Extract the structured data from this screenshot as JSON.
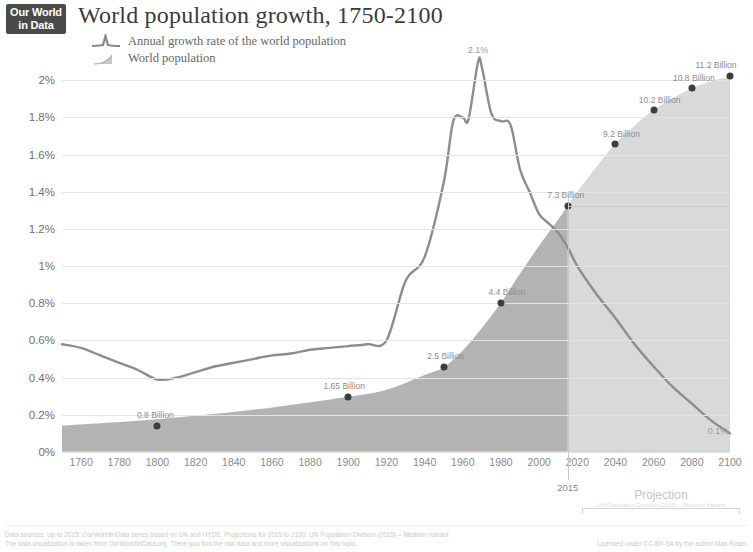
{
  "branding": {
    "line1": "Our World",
    "line2": "in Data"
  },
  "header": {
    "title": "World population growth, 1750-2100"
  },
  "legend": {
    "items": [
      {
        "id": "growth-rate",
        "label": "Annual growth rate of the world population",
        "mark": "line-peak",
        "color": "#8a8a8a"
      },
      {
        "id": "population",
        "label": "World population",
        "mark": "area-wedge",
        "color": "#b9b9b9"
      }
    ]
  },
  "axes": {
    "y": {
      "ticks": [
        "0%",
        "0.2%",
        "0.4%",
        "0.6%",
        "0.8%",
        "1%",
        "1.2%",
        "1.4%",
        "1.6%",
        "1.8%",
        "2%"
      ],
      "values": [
        0,
        0.2,
        0.4,
        0.6,
        0.8,
        1.0,
        1.2,
        1.4,
        1.6,
        1.8,
        2.0
      ],
      "min": 0,
      "max": 2.12
    },
    "x": {
      "ticks": [
        "1760",
        "1780",
        "1800",
        "1820",
        "1840",
        "1860",
        "1880",
        "1900",
        "1920",
        "1940",
        "1960",
        "1980",
        "2000",
        "2020",
        "2040",
        "2060",
        "2080",
        "2100"
      ],
      "values": [
        1760,
        1780,
        1800,
        1820,
        1840,
        1860,
        1880,
        1900,
        1920,
        1940,
        1960,
        1980,
        2000,
        2020,
        2040,
        2060,
        2080,
        2100
      ],
      "min": 1750,
      "max": 2100
    }
  },
  "annotations": {
    "projection_year": "2015",
    "projection_label": "Projection",
    "projection_sublabel": "UN Population Division (2015) – Medium Variant",
    "peak_growth": {
      "label": "2.1%",
      "year": 1968,
      "value": 2.1
    },
    "end_growth": {
      "label": "0.1%",
      "year": 2100,
      "value": 0.1
    }
  },
  "footer": {
    "line1": "Data sources: Up to 2015: OurWorldInData series based on UN and HYDE. Projections for 2015 to 2100: UN Population Division (2015) – Medium Variant",
    "line2": "The data visualization is taken from OurWorldInData.org. There you find the raw data and more visualizations on this topic.",
    "license": "Licensed under CC-BY-SA by the author Max Roser."
  },
  "colors": {
    "population_area_historic": "#b3b3b3",
    "population_area_projection": "#d9d9d9",
    "growth_line": "#8d8d8d",
    "dot": "#3d3d3d",
    "grid": "#e4e4e4",
    "text": "#7a7a7a"
  },
  "chart_data": {
    "type": "line",
    "title": "World population growth, 1750-2100",
    "xlabel": "",
    "ylabel": "",
    "xlim": [
      1750,
      2100
    ],
    "ylim": [
      0,
      2.12
    ],
    "grid": true,
    "legend_position": "top-left",
    "series": [
      {
        "name": "Annual growth rate of the world population",
        "type": "line",
        "axis": "left",
        "unit": "%",
        "x": [
          1750,
          1760,
          1770,
          1780,
          1790,
          1800,
          1810,
          1820,
          1830,
          1840,
          1850,
          1860,
          1870,
          1880,
          1890,
          1900,
          1910,
          1920,
          1930,
          1940,
          1950,
          1955,
          1960,
          1963,
          1968,
          1970,
          1975,
          1980,
          1985,
          1990,
          1995,
          2000,
          2005,
          2010,
          2015,
          2020,
          2030,
          2040,
          2050,
          2060,
          2070,
          2080,
          2090,
          2100
        ],
        "y": [
          0.58,
          0.56,
          0.52,
          0.48,
          0.44,
          0.39,
          0.4,
          0.43,
          0.46,
          0.48,
          0.5,
          0.52,
          0.53,
          0.55,
          0.56,
          0.57,
          0.58,
          0.6,
          0.92,
          1.05,
          1.45,
          1.78,
          1.8,
          1.79,
          2.1,
          2.07,
          1.82,
          1.78,
          1.76,
          1.52,
          1.4,
          1.28,
          1.23,
          1.18,
          1.1,
          1.0,
          0.85,
          0.72,
          0.58,
          0.46,
          0.35,
          0.26,
          0.17,
          0.1
        ]
      },
      {
        "name": "World population",
        "type": "area",
        "axis": "right",
        "unit": "Billion",
        "x": [
          1750,
          1800,
          1850,
          1900,
          1920,
          1940,
          1950,
          1960,
          1970,
          1980,
          1990,
          2000,
          2010,
          2015,
          2020,
          2030,
          2040,
          2050,
          2060,
          2070,
          2080,
          2090,
          2100
        ],
        "y": [
          0.79,
          0.98,
          1.26,
          1.65,
          1.86,
          2.3,
          2.53,
          3.03,
          3.7,
          4.44,
          5.32,
          6.15,
          6.93,
          7.35,
          7.76,
          8.5,
          9.2,
          9.73,
          10.2,
          10.55,
          10.85,
          11.05,
          11.2
        ]
      }
    ],
    "point_labels": [
      {
        "label": "0.8 Billion",
        "year": 1800,
        "value": 0.79,
        "dx": -2,
        "dy": -11
      },
      {
        "label": "1.65 Billion",
        "year": 1900,
        "value": 1.65,
        "dx": -4,
        "dy": -11
      },
      {
        "label": "2.5 Billion",
        "year": 1950,
        "value": 2.53,
        "dx": 2,
        "dy": -11
      },
      {
        "label": "4.4 Billion",
        "year": 1980,
        "value": 4.44,
        "dx": 6,
        "dy": -11
      },
      {
        "label": "7.3 Billion",
        "year": 2015,
        "value": 7.35,
        "dx": -2,
        "dy": -11
      },
      {
        "label": "9.2 Billion",
        "year": 2040,
        "value": 9.2,
        "dx": 6,
        "dy": -10
      },
      {
        "label": "10.2 Billion",
        "year": 2060,
        "value": 10.2,
        "dx": 6,
        "dy": -10
      },
      {
        "label": "10.8 Billion",
        "year": 2080,
        "value": 10.85,
        "dx": 2,
        "dy": -10
      },
      {
        "label": "11.2 Billion",
        "year": 2100,
        "value": 11.2,
        "dx": -14,
        "dy": -11
      }
    ]
  }
}
